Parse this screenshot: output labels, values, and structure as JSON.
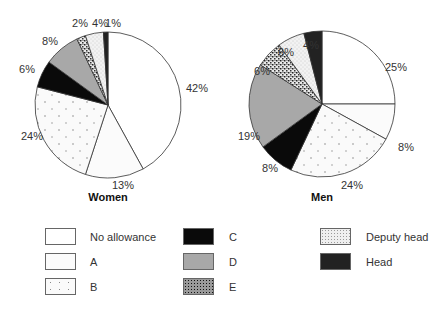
{
  "chart_data": [
    {
      "type": "pie",
      "title": "Women",
      "categories": [
        "No allowance",
        "A",
        "B",
        "C",
        "D",
        "E",
        "Deputy head",
        "Head"
      ],
      "values": [
        42,
        13,
        24,
        6,
        8,
        2,
        4,
        1
      ],
      "labels": [
        "42%",
        "13%",
        "24%",
        "6%",
        "8%",
        "2%",
        "4%",
        "1%"
      ],
      "start_angle": "12 o'clock, clockwise"
    },
    {
      "type": "pie",
      "title": "Men",
      "categories": [
        "No allowance",
        "A",
        "B",
        "C",
        "D",
        "E",
        "Deputy head",
        "Head"
      ],
      "values": [
        25,
        8,
        24,
        8,
        19,
        6,
        6,
        4
      ],
      "labels": [
        "25%",
        "8%",
        "24%",
        "8%",
        "19%",
        "6%",
        "6%",
        "4%"
      ],
      "start_angle": "12 o'clock, clockwise"
    }
  ],
  "legend": {
    "position": "bottom",
    "items": [
      {
        "label": "No allowance",
        "fill": "#ffffff",
        "pattern": "none"
      },
      {
        "label": "A",
        "fill": "#fbfbfb",
        "pattern": "none"
      },
      {
        "label": "B",
        "fill": "#fafafa",
        "pattern": "sparse-dots"
      },
      {
        "label": "C",
        "fill": "#0a0a0a",
        "pattern": "none"
      },
      {
        "label": "D",
        "fill": "#a8a8a8",
        "pattern": "none"
      },
      {
        "label": "E",
        "fill": "#9a9a9a",
        "pattern": "dense-speckle"
      },
      {
        "label": "Deputy head",
        "fill": "#efefef",
        "pattern": "fine-dots"
      },
      {
        "label": "Head",
        "fill": "#222222",
        "pattern": "none"
      }
    ]
  }
}
